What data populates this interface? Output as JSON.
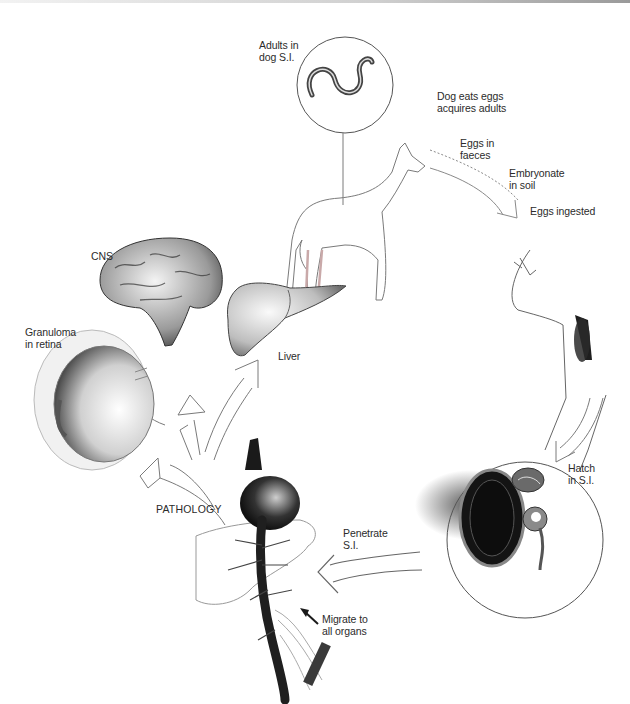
{
  "diagram": {
    "type": "life-cycle illustration",
    "colors": {
      "background": "#ffffff",
      "ink": "#2b2b2b",
      "shade": "#555555",
      "outline": "#7a7a7a"
    },
    "labels": {
      "adults_in_dog": "Adults in\ndog S.I.",
      "dog_eats_eggs": "Dog eats eggs\nacquires adults",
      "eggs_in_faeces": "Eggs in\nfaeces",
      "embryonate": "Embryonate\nin soil",
      "eggs_ingested": "Eggs ingested",
      "hatch": "Hatch\nin S.I.",
      "penetrate": "Penetrate\nS.I.",
      "migrate": "Migrate to\nall organs",
      "pathology": "PATHOLOGY",
      "cns": "CNS",
      "liver": "Liver",
      "granuloma": "Granuloma\nin retina"
    },
    "nodes": [
      {
        "id": "dog",
        "depicts": "dog with magnified inset of adult worms in small intestine"
      },
      {
        "id": "child-head",
        "depicts": "human head/throat swallowing eggs"
      },
      {
        "id": "intestine",
        "depicts": "magnified small intestine with hatching larvae"
      },
      {
        "id": "circulation",
        "depicts": "heart, liver outline and vessels"
      },
      {
        "id": "brain",
        "depicts": "brain"
      },
      {
        "id": "liver-organ",
        "depicts": "liver"
      },
      {
        "id": "eye",
        "depicts": "cross-section of eye"
      }
    ],
    "flow": [
      "dog",
      "child-head",
      "intestine",
      "circulation",
      "pathology"
    ],
    "pathology_targets": [
      "brain",
      "liver-organ",
      "eye"
    ]
  }
}
